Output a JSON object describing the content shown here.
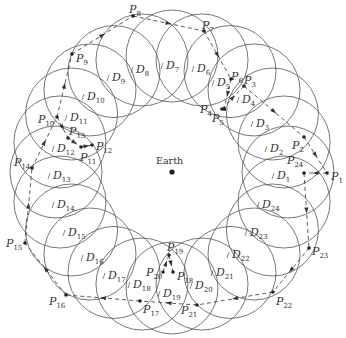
{
  "center": {
    "label": "Earth",
    "x": 172,
    "y": 172
  },
  "ring": {
    "cx": 172,
    "cy": 172,
    "r": 116,
    "disc_r": 46,
    "count": 24
  },
  "colors": {
    "stroke": "#555555",
    "path": "#333333",
    "text": "#333333",
    "bg": "#ffffff"
  },
  "discs": [
    {
      "name": "D",
      "sub": "1",
      "x": 277,
      "y": 176
    },
    {
      "name": "D",
      "sub": "2",
      "x": 270,
      "y": 149
    },
    {
      "name": "D",
      "sub": "3",
      "x": 256,
      "y": 124
    },
    {
      "name": "D",
      "sub": "4",
      "x": 242,
      "y": 100
    },
    {
      "name": "D",
      "sub": "5",
      "x": 217,
      "y": 83
    },
    {
      "name": "D",
      "sub": "6",
      "x": 197,
      "y": 69
    },
    {
      "name": "D",
      "sub": "7",
      "x": 166,
      "y": 66
    },
    {
      "name": "D",
      "sub": "8",
      "x": 136,
      "y": 70
    },
    {
      "name": "D",
      "sub": "9",
      "x": 112,
      "y": 78
    },
    {
      "name": "D",
      "sub": "10",
      "x": 87,
      "y": 97
    },
    {
      "name": "D",
      "sub": "11",
      "x": 70,
      "y": 118
    },
    {
      "name": "D",
      "sub": "12",
      "x": 57,
      "y": 149
    },
    {
      "name": "D",
      "sub": "13",
      "x": 53,
      "y": 176
    },
    {
      "name": "D",
      "sub": "14",
      "x": 57,
      "y": 205
    },
    {
      "name": "D",
      "sub": "15",
      "x": 68,
      "y": 233
    },
    {
      "name": "D",
      "sub": "16",
      "x": 86,
      "y": 258
    },
    {
      "name": "D",
      "sub": "17",
      "x": 108,
      "y": 276
    },
    {
      "name": "D",
      "sub": "18",
      "x": 133,
      "y": 285
    },
    {
      "name": "D",
      "sub": "19",
      "x": 163,
      "y": 294
    },
    {
      "name": "D",
      "sub": "20",
      "x": 195,
      "y": 286
    },
    {
      "name": "D",
      "sub": "21",
      "x": 216,
      "y": 273
    },
    {
      "name": "D",
      "sub": "22",
      "x": 232,
      "y": 255
    },
    {
      "name": "D",
      "sub": "23",
      "x": 250,
      "y": 233
    },
    {
      "name": "D",
      "sub": "24",
      "x": 262,
      "y": 205
    }
  ],
  "points": [
    {
      "name": "P",
      "sub": "1",
      "x": 327,
      "y": 173,
      "lx": 331,
      "ly": 180
    },
    {
      "name": "P",
      "sub": "2",
      "x": 304,
      "y": 137,
      "lx": 292,
      "ly": 149
    },
    {
      "name": "P",
      "sub": "3",
      "x": 244,
      "y": 86,
      "lx": 244,
      "ly": 84
    },
    {
      "name": "P",
      "sub": "4",
      "x": 222,
      "y": 109,
      "lx": 200,
      "ly": 113
    },
    {
      "name": "P",
      "sub": "5",
      "x": 224,
      "y": 109,
      "lx": 212,
      "ly": 122
    },
    {
      "name": "P",
      "sub": "6",
      "x": 231,
      "y": 79,
      "lx": 231,
      "ly": 80
    },
    {
      "name": "P",
      "sub": "7",
      "x": 204,
      "y": 31,
      "lx": 202,
      "ly": 29
    },
    {
      "name": "P",
      "sub": "8",
      "x": 133,
      "y": 16,
      "lx": 129,
      "ly": 13
    },
    {
      "name": "P",
      "sub": "9",
      "x": 72,
      "y": 54,
      "lx": 76,
      "ly": 62
    },
    {
      "name": "P",
      "sub": "10",
      "x": 57,
      "y": 117,
      "lx": 38,
      "ly": 123
    },
    {
      "name": "P",
      "sub": "11",
      "x": 81,
      "y": 147,
      "lx": 80,
      "ly": 161
    },
    {
      "name": "P",
      "sub": "12",
      "x": 92,
      "y": 145,
      "lx": 96,
      "ly": 150
    },
    {
      "name": "P",
      "sub": "13",
      "x": 68,
      "y": 138,
      "lx": 69,
      "ly": 135
    },
    {
      "name": "P",
      "sub": "14",
      "x": 32,
      "y": 168,
      "lx": 14,
      "ly": 166
    },
    {
      "name": "P",
      "sub": "15",
      "x": 25,
      "y": 243,
      "lx": 6,
      "ly": 247
    },
    {
      "name": "P",
      "sub": "16",
      "x": 66,
      "y": 295,
      "lx": 49,
      "ly": 305
    },
    {
      "name": "P",
      "sub": "17",
      "x": 140,
      "y": 301,
      "lx": 143,
      "ly": 313
    },
    {
      "name": "P",
      "sub": "18",
      "x": 173,
      "y": 272,
      "lx": 177,
      "ly": 280
    },
    {
      "name": "P",
      "sub": "19",
      "x": 169,
      "y": 255,
      "lx": 167,
      "ly": 251
    },
    {
      "name": "P",
      "sub": "20",
      "x": 163,
      "y": 272,
      "lx": 146,
      "ly": 276
    },
    {
      "name": "P",
      "sub": "21",
      "x": 197,
      "y": 305,
      "lx": 181,
      "ly": 314
    },
    {
      "name": "P",
      "sub": "22",
      "x": 273,
      "y": 292,
      "lx": 276,
      "ly": 305
    },
    {
      "name": "P",
      "sub": "23",
      "x": 309,
      "y": 248,
      "lx": 312,
      "ly": 255
    },
    {
      "name": "P",
      "sub": "24",
      "x": 304,
      "y": 173,
      "lx": 287,
      "ly": 164
    }
  ],
  "path_order": [
    "1",
    "24",
    "23",
    "22",
    "21",
    "17",
    "16",
    "15",
    "14",
    "10",
    "9",
    "8",
    "7",
    "6",
    "5",
    "4",
    "3",
    "2",
    "1"
  ],
  "inner_path_order": [
    "10",
    "13",
    "11",
    "12"
  ],
  "inner_path_order2": [
    "20",
    "19",
    "18"
  ]
}
